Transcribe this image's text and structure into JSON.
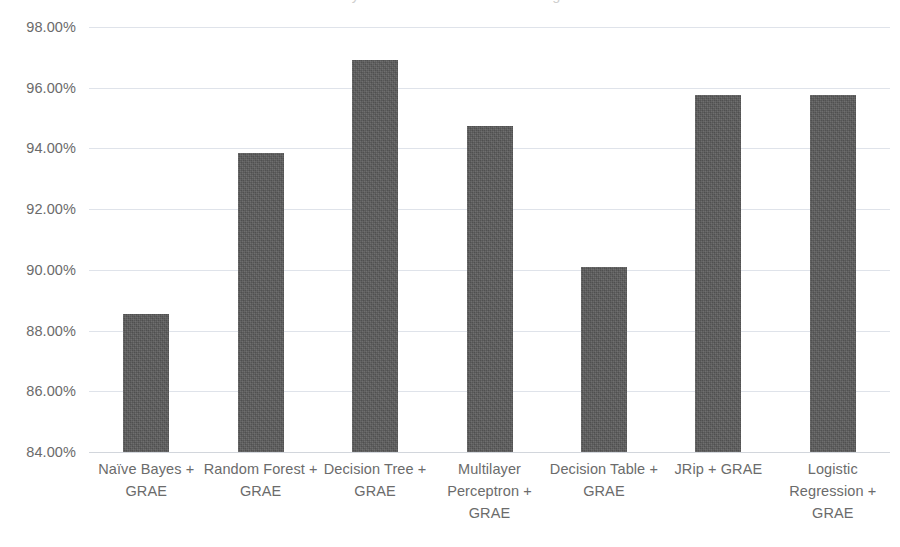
{
  "chart_data": {
    "type": "bar",
    "title": "",
    "xlabel": "",
    "ylabel": "",
    "ylim": [
      84,
      98
    ],
    "ytick_step": 2,
    "grid": true,
    "legend": false,
    "bar_color": "#595959",
    "gridline_color": "#dfe3ea",
    "value_suffix": "%",
    "categories": [
      "Naïve Bayes + GRAE",
      "Random Forest + GRAE",
      "Decision Tree + GRAE",
      "Multilayer Perceptron + GRAE",
      "Decision Table + GRAE",
      "JRip + GRAE",
      "Logistic Regression + GRAE"
    ],
    "values": [
      88.55,
      93.85,
      96.9,
      94.73,
      90.1,
      95.77,
      95.77
    ],
    "ytick_labels": [
      "98.00%",
      "96.00%",
      "94.00%",
      "92.00%",
      "90.00%",
      "88.00%",
      "86.00%",
      "84.00%"
    ],
    "ytick_values": [
      98,
      96,
      94,
      92,
      90,
      88,
      86,
      84
    ]
  },
  "title_remnant": {
    "text": "Accuracy of Classifiers with Genetic Algorithm"
  }
}
